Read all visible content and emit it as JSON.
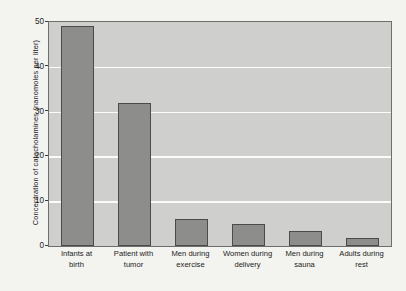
{
  "chart_data": {
    "type": "bar",
    "title": "",
    "xlabel": "",
    "ylabel": "Concentration of catecholamines (nanomoles per liter)",
    "ylim": [
      0,
      50
    ],
    "yticks": [
      0,
      10,
      20,
      30,
      40,
      50
    ],
    "grid": true,
    "legend": false,
    "categories": [
      "Infants at birth",
      "Patient with tumor",
      "Men during exercise",
      "Women during delivery",
      "Men during sauna",
      "Adults during rest"
    ],
    "category_lines": [
      [
        "Infants at",
        "birth"
      ],
      [
        "Patient with",
        "tumor"
      ],
      [
        "Men during",
        "exercise"
      ],
      [
        "Women during",
        "delivery"
      ],
      [
        "Men during",
        "sauna"
      ],
      [
        "Adults during",
        "rest"
      ]
    ],
    "values": [
      49,
      32,
      6,
      5,
      3.3,
      1.8
    ],
    "colors": {
      "bar_fill": "#8d8d8b",
      "bar_edge": "#4b4b49",
      "plot_background": "#cfcfcd",
      "gridline": "#fbfbfa",
      "figure_background": "#f3f3f0",
      "text": "#1d1c1a"
    }
  }
}
